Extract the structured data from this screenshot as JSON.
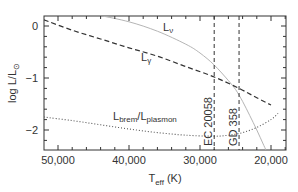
{
  "chart_data": {
    "type": "line",
    "title": "",
    "xlabel": "T_eff (K)",
    "ylabel": "log L/L_sun",
    "xlim": [
      52000,
      18000
    ],
    "ylim": [
      -2.4,
      0.2
    ],
    "x_reversed": true,
    "grid": false,
    "xticks": [
      50000,
      40000,
      30000,
      20000
    ],
    "xtick_labels": [
      "50,000",
      "40,000",
      "30,000",
      "20,000"
    ],
    "yticks": [
      0,
      -1,
      -2
    ],
    "ytick_labels": [
      "0",
      "−1",
      "−2"
    ],
    "series": [
      {
        "name": "L_nu",
        "label": "Lν",
        "style": "solid-light",
        "x": [
          44000,
          40000,
          36000,
          32000,
          30000,
          28000,
          26000,
          25000,
          24000,
          23000,
          22000,
          21000,
          20000
        ],
        "y": [
          0.2,
          0.08,
          -0.1,
          -0.35,
          -0.52,
          -0.75,
          -1.05,
          -1.22,
          -1.45,
          -1.72,
          -2.0,
          -2.3,
          -2.6
        ]
      },
      {
        "name": "L_gamma",
        "label": "Lγ",
        "style": "dashed",
        "x": [
          52000,
          48000,
          44000,
          40000,
          36000,
          32000,
          28000,
          24500,
          22000,
          20000
        ],
        "y": [
          0.12,
          -0.08,
          -0.25,
          -0.42,
          -0.58,
          -0.78,
          -0.98,
          -1.2,
          -1.38,
          -1.52
        ]
      },
      {
        "name": "L_brem/L_plasmon",
        "label": "Lbrem/Lplasmon",
        "style": "dotted",
        "x": [
          52000,
          48000,
          44000,
          40000,
          36000,
          32000,
          28000,
          26000,
          24000,
          22000,
          20000,
          19000
        ],
        "y": [
          -1.75,
          -1.82,
          -1.9,
          -1.98,
          -2.05,
          -2.1,
          -2.12,
          -2.1,
          -2.05,
          -1.95,
          -1.8,
          -1.68
        ]
      }
    ],
    "vertical_lines": [
      {
        "name": "EC 20058",
        "x": 28000,
        "style": "dashed"
      },
      {
        "name": "GD 358",
        "x": 24500,
        "style": "dashed"
      }
    ],
    "annotations": [
      {
        "text": "Lν",
        "x": 37000,
        "y": 0.05
      },
      {
        "text": "Lγ",
        "x": 34000,
        "y": -0.55
      },
      {
        "text": "Lbrem/Lplasmon",
        "x": 38500,
        "y": -1.8
      }
    ]
  },
  "labels": {
    "ylabel_main": "log L/L",
    "ylabel_sub": "⊙",
    "xlabel_main": "T",
    "xlabel_sub": "eff",
    "xlabel_unit": " (K)",
    "l_nu_main": "L",
    "l_nu_sub": "ν",
    "l_gamma_main": "L",
    "l_gamma_sub": "γ",
    "brem_main1": "L",
    "brem_sub1": "brem",
    "brem_main2": "/L",
    "brem_sub2": "plasmon",
    "ec_label": "EC 20058",
    "gd_label": "GD 358",
    "xt0": "50,000",
    "xt1": "40,000",
    "xt2": "30,000",
    "xt3": "20,000",
    "yt0": "0",
    "yt1": "−1",
    "yt2": "−2"
  }
}
